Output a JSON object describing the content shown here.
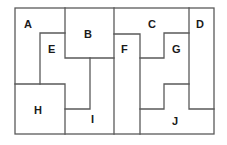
{
  "diagram": {
    "type": "partition-puzzle",
    "line_color": "#5a5a5a",
    "label_color": "#1a1a1a",
    "regions": [
      {
        "label": "A",
        "x": 24,
        "y": 28
      },
      {
        "label": "B",
        "x": 84,
        "y": 38
      },
      {
        "label": "C",
        "x": 148,
        "y": 28
      },
      {
        "label": "D",
        "x": 196,
        "y": 28
      },
      {
        "label": "E",
        "x": 48,
        "y": 53
      },
      {
        "label": "F",
        "x": 121,
        "y": 53
      },
      {
        "label": "G",
        "x": 172,
        "y": 53
      },
      {
        "label": "H",
        "x": 34,
        "y": 114
      },
      {
        "label": "I",
        "x": 91,
        "y": 123
      },
      {
        "label": "J",
        "x": 172,
        "y": 125
      }
    ]
  }
}
